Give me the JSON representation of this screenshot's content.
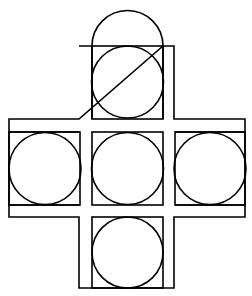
{
  "diagram": {
    "title": "",
    "stroke_color": "#000000",
    "background_color": "#ffffff",
    "cells": [
      {
        "id": "top",
        "label": ""
      },
      {
        "id": "left",
        "label": ""
      },
      {
        "id": "center",
        "label": ""
      },
      {
        "id": "right",
        "label": ""
      },
      {
        "id": "bottom",
        "label": ""
      }
    ]
  }
}
